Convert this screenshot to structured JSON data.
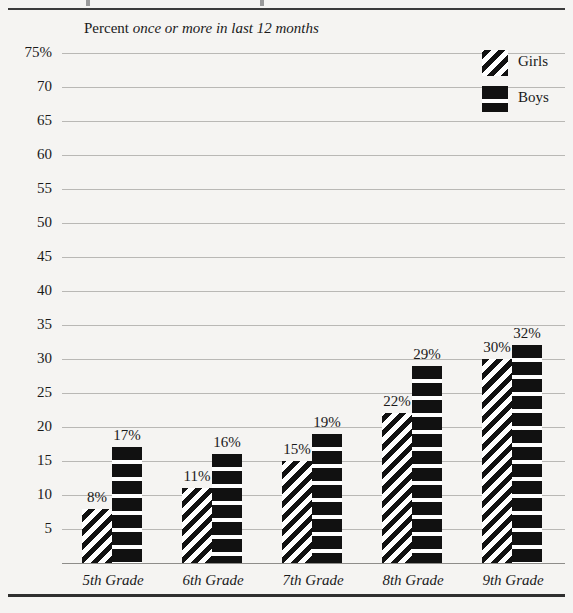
{
  "figure": {
    "subtitle_roman": "Percent",
    "subtitle_italic": "once or more in last 12 months"
  },
  "legend": {
    "position": "top-right",
    "entries": [
      {
        "label": "Girls",
        "pattern": "diagonal-stripes"
      },
      {
        "label": "Boys",
        "pattern": "horizontal-bands"
      }
    ]
  },
  "chart_data": {
    "type": "bar",
    "title": "",
    "subtitle": "Percent once or more in last 12 months",
    "xlabel": "",
    "ylabel": "",
    "ylim": [
      0,
      75
    ],
    "ytick_suffix_top": "%",
    "grid": true,
    "categories": [
      "5th Grade",
      "6th Grade",
      "7th Grade",
      "8th Grade",
      "9th Grade"
    ],
    "yticks": [
      75,
      70,
      65,
      60,
      55,
      50,
      45,
      40,
      35,
      30,
      25,
      20,
      15,
      10,
      5
    ],
    "ytick_labels": [
      "75%",
      "70",
      "65",
      "60",
      "55",
      "50",
      "45",
      "40",
      "35",
      "30",
      "25",
      "20",
      "15",
      "10",
      "5"
    ],
    "series": [
      {
        "name": "Girls",
        "pattern": "diagonal-stripes",
        "values": [
          8,
          11,
          15,
          22,
          30
        ],
        "data_labels": [
          "8%",
          "11%",
          "15%",
          "22%",
          "30%"
        ]
      },
      {
        "name": "Boys",
        "pattern": "horizontal-bands",
        "values": [
          17,
          16,
          19,
          29,
          32
        ],
        "data_labels": [
          "17%",
          "16%",
          "19%",
          "29%",
          "32%"
        ]
      }
    ]
  },
  "colors": {
    "background": "#f5f4f2",
    "ink": "#111111",
    "gridline": "#b9b8b5",
    "rule": "#2f2f2f"
  }
}
